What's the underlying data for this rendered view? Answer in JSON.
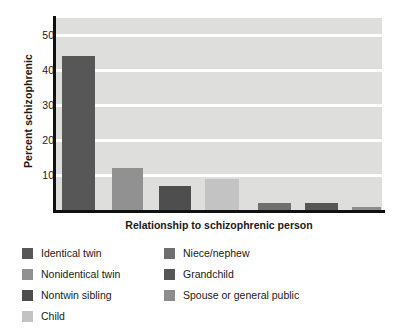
{
  "chart_data": {
    "type": "bar",
    "title": "",
    "xlabel": "Relationship to schizophrenic person",
    "ylabel": "Percent schizophrenic",
    "categories": [
      "Identical twin",
      "Nonidentical twin",
      "Nontwin sibling",
      "Child",
      "Niece/nephew",
      "Grandchild",
      "Spouse or general public"
    ],
    "values": [
      44,
      12,
      7,
      9,
      2,
      2,
      1
    ],
    "ylim": [
      0,
      55
    ],
    "yticks": [
      10,
      20,
      30,
      40,
      50
    ],
    "ytick_labels": [
      "10",
      "20",
      "30",
      "40",
      "50"
    ],
    "grid": "horizontal-white",
    "legend_position": "below",
    "bar_colors": [
      "#575757",
      "#919191",
      "#4e4e4e",
      "#c3c3c3",
      "#6f6f6f",
      "#565656",
      "#8d8d8d"
    ],
    "plot_background": "#dededd",
    "axis_color": "#111111",
    "gridline_color": "#ffffff"
  },
  "axes": {
    "ylabel": "Percent schizophrenic",
    "xlabel": "Relationship to schizophrenic person",
    "ytick_labels": [
      "10",
      "20",
      "30",
      "40",
      "50"
    ]
  },
  "legend": {
    "left_column": [
      {
        "label": "Identical twin",
        "color": "#575757"
      },
      {
        "label": "Nonidentical twin",
        "color": "#919191"
      },
      {
        "label": "Nontwin sibling",
        "color": "#4e4e4e"
      },
      {
        "label": "Child",
        "color": "#c3c3c3"
      }
    ],
    "right_column": [
      {
        "label": "Niece/nephew",
        "color": "#6f6f6f"
      },
      {
        "label": "Grandchild",
        "color": "#565656"
      },
      {
        "label": "Spouse or general public",
        "color": "#8d8d8d"
      }
    ]
  }
}
